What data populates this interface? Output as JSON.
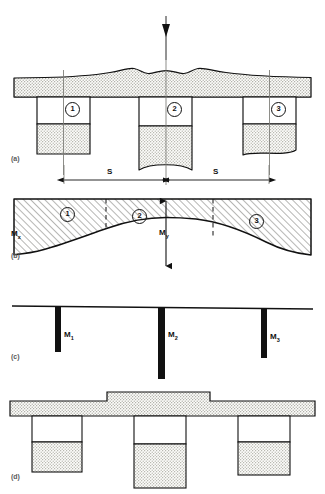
{
  "figure": {
    "type": "engineering-cross-section-diagram",
    "panel_count": 4
  },
  "panels": [
    {
      "id": "a",
      "label": "(a)",
      "description": "Deck cross-section with three girder stems under central point load",
      "beam_markers": [
        "1",
        "2",
        "3"
      ],
      "load_arrow": "downward-point-load",
      "dimensions": [
        {
          "label": "S",
          "between": [
            "1",
            "2"
          ]
        },
        {
          "label": "S",
          "between": [
            "2",
            "3"
          ]
        }
      ]
    },
    {
      "id": "b",
      "label": "(b)",
      "description": "Transverse bending moment diagram with hatched area",
      "axis_label": "Mx",
      "axis_label_base": "M",
      "axis_label_sub": "x",
      "peak_label": "My",
      "peak_label_base": "M",
      "peak_label_sub": "y",
      "beam_markers": [
        "1",
        "2",
        "3"
      ]
    },
    {
      "id": "c",
      "label": "(c)",
      "description": "Resultant girder moments shown as vertical bars",
      "moments": [
        {
          "base": "M",
          "sub": "1"
        },
        {
          "base": "M",
          "sub": "2"
        },
        {
          "base": "M",
          "sub": "3"
        }
      ]
    },
    {
      "id": "d",
      "label": "(d)",
      "description": "Resulting deck with thickened central slab region and three stems"
    }
  ],
  "colors": {
    "ink": "#111111",
    "stipple": "#d9d9d2",
    "hatch": "#ffffff",
    "faint_label": "#5a5a5a",
    "background": "#ffffff"
  }
}
